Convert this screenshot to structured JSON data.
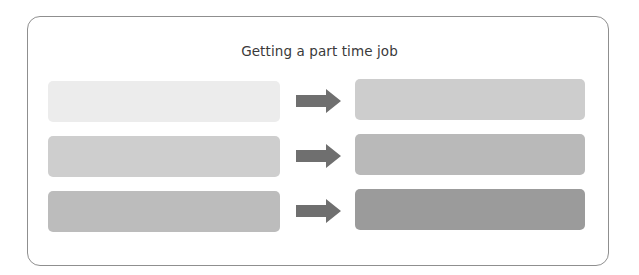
{
  "diagram": {
    "title": "Getting a part time job",
    "frame_border_color": "#8f8f8f",
    "arrow_color": "#6f6f6f",
    "arrow_icon": "right-arrow-icon",
    "rows": [
      {
        "left": {
          "label": "",
          "color": "#ececec"
        },
        "right": {
          "label": "",
          "color": "#cdcdcd"
        }
      },
      {
        "left": {
          "label": "",
          "color": "#cecece"
        },
        "right": {
          "label": "",
          "color": "#b9b9b9"
        }
      },
      {
        "left": {
          "label": "",
          "color": "#bcbcbc"
        },
        "right": {
          "label": "",
          "color": "#9b9b9b"
        }
      }
    ]
  }
}
